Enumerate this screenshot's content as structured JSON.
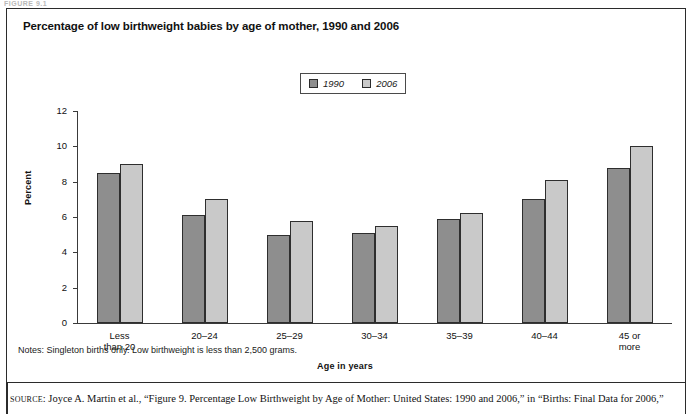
{
  "top_sliver_text": "FIGURE 9.1",
  "figure": {
    "title": "Percentage of low birthweight babies by age of mother, 1990 and 2006",
    "notes": "Notes: Singleton births only. Low birthweight is less than 2,500 grams.",
    "source_prefix": "SOURCE",
    "source_text": ": Joyce A. Martin et al., “Figure 9. Percentage Low Birthweight by Age of Mother: United States: 1990 and 2006,” in “Births: Final Data for 2006,”"
  },
  "colors": {
    "series_1990": "#8e8e8e",
    "series_2006": "#c9c9c9",
    "border": "#2e2e2e",
    "axis": "#3a3a3a",
    "text": "#111111"
  },
  "legend": {
    "position": "top-center",
    "items": [
      {
        "label": "1990",
        "color": "#8e8e8e"
      },
      {
        "label": "2006",
        "color": "#c9c9c9"
      }
    ]
  },
  "chart_data": {
    "type": "bar",
    "title": "Percentage of low birthweight babies by age of mother, 1990 and 2006",
    "xlabel": "Age in years",
    "ylabel": "Percent",
    "ylim": [
      0,
      12
    ],
    "yticks": [
      0,
      2,
      4,
      6,
      8,
      10,
      12
    ],
    "grid": false,
    "legend_position": "top-center",
    "categories": [
      "Less\nthan 20",
      "20–24",
      "25–29",
      "30–34",
      "35–39",
      "40–44",
      "45 or\nmore"
    ],
    "series": [
      {
        "name": "1990",
        "color": "#8e8e8e",
        "values": [
          8.5,
          6.1,
          5.0,
          5.1,
          5.9,
          7.0,
          8.8
        ]
      },
      {
        "name": "2006",
        "color": "#c9c9c9",
        "values": [
          9.0,
          7.0,
          5.8,
          5.5,
          6.2,
          8.1,
          10.0
        ]
      }
    ]
  }
}
